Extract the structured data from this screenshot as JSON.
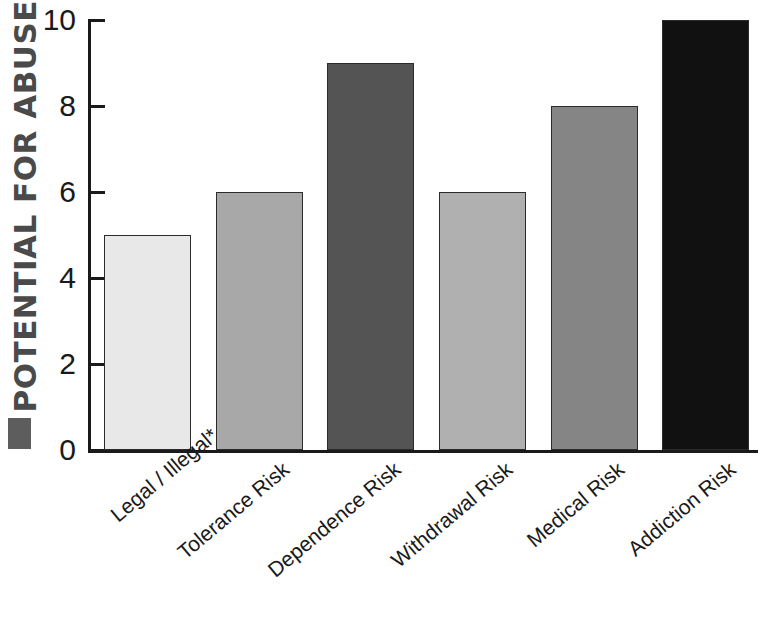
{
  "chart_data": {
    "type": "bar",
    "title": "",
    "subtitle": "",
    "xlabel": "",
    "ylabel": "POTENTIAL FOR ABUSE",
    "categories": [
      "Legal / Illegal*",
      "Tolerance Risk",
      "Dependence Risk",
      "Withdrawal Risk",
      "Medical Risk",
      "Addiction Risk"
    ],
    "values": [
      5,
      6,
      9,
      6,
      8,
      10
    ],
    "bar_colors": [
      "#e8e8e8",
      "#a8a8a8",
      "#545454",
      "#b0b0b0",
      "#858585",
      "#111111"
    ],
    "bar_edge_color": "#2b2b2b",
    "ylim": [
      0,
      10
    ],
    "yticks": [
      0,
      2,
      4,
      6,
      8,
      10
    ],
    "ytick_labels": [
      "0",
      "2",
      "4",
      "6",
      "8",
      "10"
    ],
    "grid": false,
    "legend": null,
    "axis_color": "#1a1a1a",
    "ylabel_color": "#4a4a4a",
    "ylabel_marker_color": "#5d5d5d",
    "background": "#ffffff",
    "annotations": [
      "*"
    ]
  }
}
